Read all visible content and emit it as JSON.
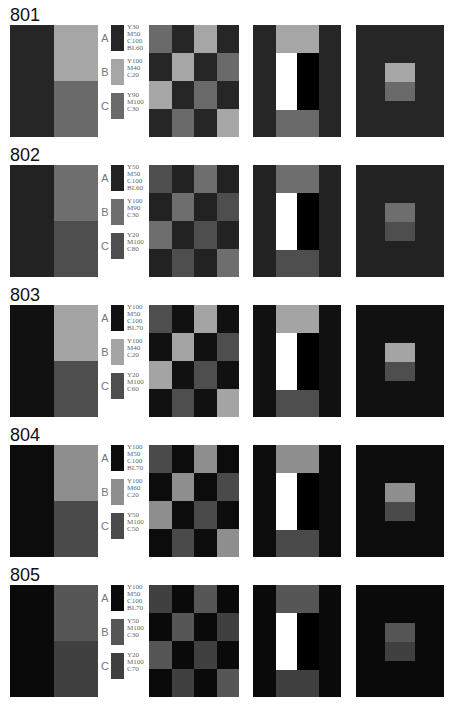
{
  "sections": [
    {
      "id": "801",
      "colors": {
        "A": "#262626",
        "B": "#a6a6a6",
        "C": "#6a6a6a"
      },
      "swatches": [
        {
          "letter": "A",
          "spec": "Y30\nM50\nC100\nBL60"
        },
        {
          "letter": "B",
          "spec": "Y100\nM40\nC20"
        },
        {
          "letter": "C",
          "spec": "Y90\nM100\nC30"
        }
      ],
      "checker": [
        [
          "C",
          "A",
          "B",
          "A"
        ],
        [
          "A",
          "B",
          "A",
          "C"
        ],
        [
          "B",
          "A",
          "C",
          "A"
        ],
        [
          "A",
          "C",
          "A",
          "B"
        ]
      ]
    },
    {
      "id": "802",
      "colors": {
        "A": "#222222",
        "B": "#6e6e6e",
        "C": "#4e4e4e"
      },
      "swatches": [
        {
          "letter": "A",
          "spec": "Y50\nM50\nC100\nBL60"
        },
        {
          "letter": "B",
          "spec": "Y100\nM90\nC30"
        },
        {
          "letter": "C",
          "spec": "Y20\nM100\nC80"
        }
      ],
      "checker": [
        [
          "C",
          "A",
          "B",
          "A"
        ],
        [
          "A",
          "B",
          "A",
          "C"
        ],
        [
          "B",
          "A",
          "C",
          "A"
        ],
        [
          "A",
          "C",
          "A",
          "B"
        ]
      ]
    },
    {
      "id": "803",
      "colors": {
        "A": "#111111",
        "B": "#a4a4a4",
        "C": "#4e4e4e"
      },
      "swatches": [
        {
          "letter": "A",
          "spec": "Y100\nM50\nC100\nBL70"
        },
        {
          "letter": "B",
          "spec": "Y100\nM40\nC20"
        },
        {
          "letter": "C",
          "spec": "Y20\nM100\nC60"
        }
      ],
      "checker": [
        [
          "C",
          "A",
          "B",
          "A"
        ],
        [
          "A",
          "B",
          "A",
          "C"
        ],
        [
          "B",
          "A",
          "C",
          "A"
        ],
        [
          "A",
          "C",
          "A",
          "B"
        ]
      ]
    },
    {
      "id": "804",
      "colors": {
        "A": "#0c0c0c",
        "B": "#8e8e8e",
        "C": "#4a4a4a"
      },
      "swatches": [
        {
          "letter": "A",
          "spec": "Y100\nM50\nC100\nBL70"
        },
        {
          "letter": "B",
          "spec": "Y100\nM60\nC20"
        },
        {
          "letter": "C",
          "spec": "Y50\nM100\nC50"
        }
      ],
      "checker": [
        [
          "C",
          "A",
          "B",
          "A"
        ],
        [
          "A",
          "B",
          "A",
          "C"
        ],
        [
          "B",
          "A",
          "C",
          "A"
        ],
        [
          "A",
          "C",
          "A",
          "B"
        ]
      ]
    },
    {
      "id": "805",
      "colors": {
        "A": "#0a0a0a",
        "B": "#565656",
        "C": "#404040"
      },
      "swatches": [
        {
          "letter": "A",
          "spec": "Y100\nM50\nC100\nBL70"
        },
        {
          "letter": "B",
          "spec": "Y50\nM100\nC30"
        },
        {
          "letter": "C",
          "spec": "Y20\nM100\nC70"
        }
      ],
      "checker": [
        [
          "C",
          "A",
          "B",
          "A"
        ],
        [
          "A",
          "B",
          "A",
          "C"
        ],
        [
          "B",
          "A",
          "C",
          "A"
        ],
        [
          "A",
          "C",
          "A",
          "B"
        ]
      ]
    }
  ]
}
